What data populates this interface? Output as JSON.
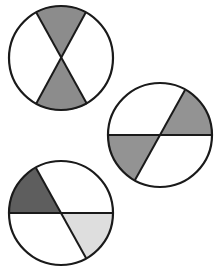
{
  "figure": {
    "colors": {
      "background": "#ffffff",
      "outline": "#1a1a1a",
      "medium_gray": "#8c8c8c",
      "dark_gray": "#5e5e5e",
      "light_gray": "#dedede",
      "white": "#ffffff"
    },
    "circles": [
      {
        "id": "circle-1",
        "cx": 61,
        "cy": 58,
        "r": 52,
        "lines": [
          [
            36,
            12,
            87,
            104
          ],
          [
            86,
            12,
            36,
            104
          ]
        ],
        "shaded": [
          {
            "name": "top-wedge",
            "fill": "#8c8c8c",
            "path": "M61,58 L36,12 A52,52 0 0,1 86,12 Z"
          },
          {
            "name": "bottom-wedge",
            "fill": "#8c8c8c",
            "path": "M61,58 L87,104 A52,52 0 0,1 36,104 Z"
          }
        ]
      },
      {
        "id": "circle-2",
        "cx": 160,
        "cy": 135,
        "r": 52,
        "lines": [
          [
            108,
            135,
            212,
            135
          ],
          [
            185,
            90,
            135,
            180
          ]
        ],
        "shaded": [
          {
            "name": "upper-right-wedge",
            "fill": "#939393",
            "path": "M160,135 L185,90 A52,52 0 0,1 212,135 Z"
          },
          {
            "name": "lower-left-wedge",
            "fill": "#939393",
            "path": "M160,135 L108,135 A52,52 0 0,0 135,180 Z"
          }
        ]
      },
      {
        "id": "circle-3",
        "cx": 61,
        "cy": 213,
        "r": 52,
        "lines": [
          [
            9,
            213,
            113,
            213
          ],
          [
            36,
            168,
            86,
            258
          ]
        ],
        "shaded": [
          {
            "name": "upper-left-wedge",
            "fill": "#5e5e5e",
            "path": "M61,213 L9,213 A52,52 0 0,1 36,168 Z"
          },
          {
            "name": "lower-right-wedge",
            "fill": "#dedede",
            "path": "M61,213 L113,213 A52,52 0 0,1 86,258 Z"
          }
        ]
      }
    ]
  }
}
